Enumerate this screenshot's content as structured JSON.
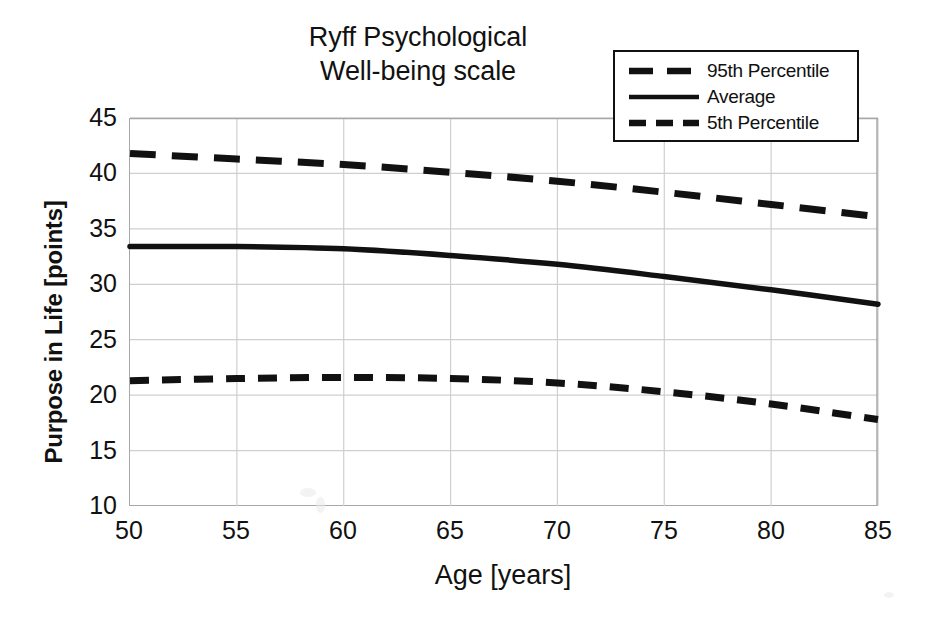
{
  "chart_data": {
    "type": "line",
    "title": "Ryff Psychological Well-being scale",
    "title_lines": [
      "Ryff Psychological",
      "Well-being scale"
    ],
    "xlabel": "Age [years]",
    "ylabel": "Purpose in Life [points]",
    "xlim": [
      50,
      85
    ],
    "ylim": [
      10,
      45
    ],
    "xticks": [
      50,
      55,
      60,
      65,
      70,
      75,
      80,
      85
    ],
    "yticks": [
      10,
      15,
      20,
      25,
      30,
      35,
      40,
      45
    ],
    "grid": true,
    "legend_position": "top-right",
    "x": [
      50,
      55,
      60,
      65,
      70,
      75,
      80,
      85
    ],
    "series": [
      {
        "name": "95th Percentile",
        "style": "long-dashed",
        "color": "#111111",
        "values": [
          41.8,
          41.3,
          40.8,
          40.1,
          39.3,
          38.3,
          37.2,
          36.1
        ]
      },
      {
        "name": "Average",
        "style": "solid",
        "color": "#111111",
        "values": [
          33.4,
          33.4,
          33.2,
          32.6,
          31.8,
          30.7,
          29.5,
          28.2
        ]
      },
      {
        "name": "5th Percentile",
        "style": "dashed",
        "color": "#111111",
        "values": [
          21.3,
          21.5,
          21.6,
          21.5,
          21.1,
          20.3,
          19.2,
          17.8
        ]
      }
    ]
  },
  "legend": {
    "items": [
      {
        "label": "95th Percentile",
        "key": "long-dash-line-icon"
      },
      {
        "label": "Average",
        "key": "solid-line-icon"
      },
      {
        "label": "5th Percentile",
        "key": "dash-line-icon"
      }
    ]
  }
}
